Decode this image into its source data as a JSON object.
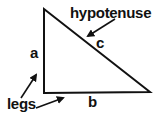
{
  "diagram": {
    "colors": {
      "stroke": "#111111",
      "background": "#ffffff"
    },
    "triangle": {
      "vertices": {
        "top": [
          44,
          9
        ],
        "right_angle": [
          44,
          93
        ],
        "right": [
          150,
          92
        ]
      }
    },
    "labels": {
      "hypotenuse": "hypotenuse",
      "c": "c",
      "a": "a",
      "b": "b",
      "legs": "legs"
    },
    "arrows": [
      {
        "name": "hypotenuse-arrow",
        "from": [
          115,
          19
        ],
        "to": [
          87,
          37
        ]
      },
      {
        "name": "leg-a-arrow",
        "from": [
          20,
          99
        ],
        "to": [
          37,
          74
        ]
      },
      {
        "name": "leg-b-arrow",
        "from": [
          36,
          108
        ],
        "to": [
          64,
          98
        ]
      }
    ]
  }
}
